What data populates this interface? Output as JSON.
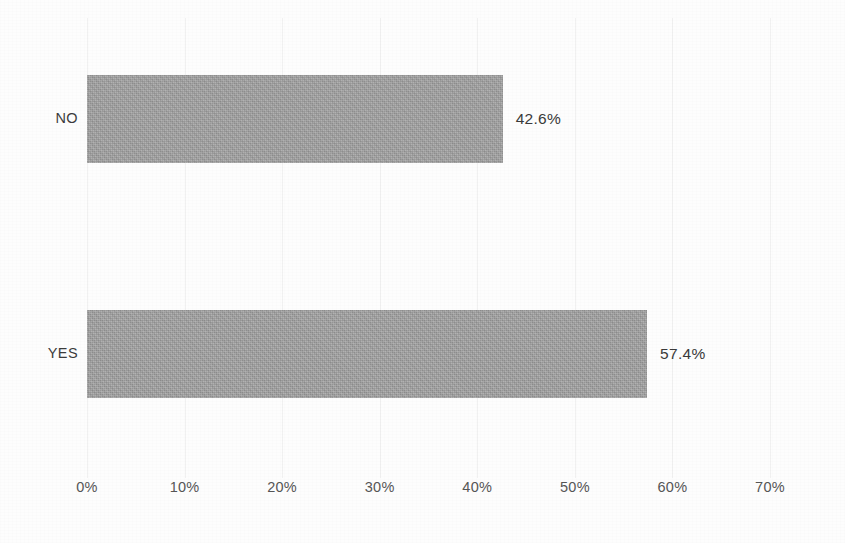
{
  "chart_data": {
    "type": "bar",
    "orientation": "horizontal",
    "title": "",
    "xlabel": "",
    "ylabel": "",
    "categories": [
      "NO",
      "YES"
    ],
    "values": [
      42.6,
      57.4
    ],
    "data_labels": [
      "42.6%",
      "57.4%"
    ],
    "xlim": [
      0,
      70
    ],
    "xticks": [
      0,
      10,
      20,
      30,
      40,
      50,
      60,
      70
    ],
    "xtick_labels": [
      "0%",
      "10%",
      "20%",
      "30%",
      "40%",
      "50%",
      "60%",
      "70%"
    ],
    "grid": true,
    "legend": false,
    "series": [
      {
        "name": "",
        "values": [
          42.6,
          57.4
        ]
      }
    ],
    "colors": {
      "bar_fill": "#a2a2a2",
      "background": "#fdfdfd",
      "gridline": "#f1f1f1",
      "tick_label": "#565656",
      "data_label": "#3a3a3a",
      "category_label": "#3c3c3c"
    }
  }
}
